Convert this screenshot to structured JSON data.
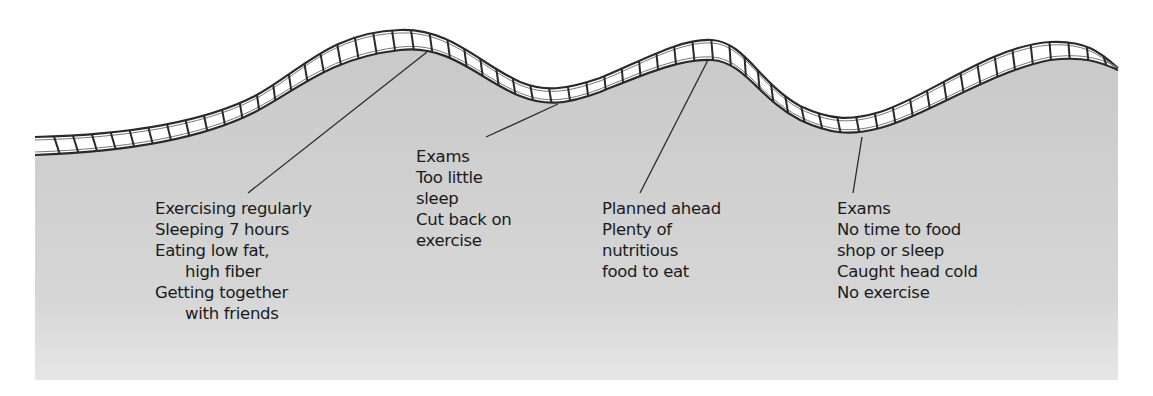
{
  "diagram": {
    "type": "roller-coaster wellness track",
    "colors": {
      "ground": "#cdcdcd",
      "ground_light": "#e4e4e4",
      "track_rail": "#2a2a2a",
      "track_fill": "#ffffff",
      "text": "#1a1a1a",
      "leader": "#2a2a2a"
    },
    "annotations": [
      {
        "id": "peak-1",
        "position": "peak",
        "lines": [
          {
            "text": "Exercising regularly",
            "indent": false
          },
          {
            "text": "Sleeping 7 hours",
            "indent": false
          },
          {
            "text": "Eating low fat,",
            "indent": false
          },
          {
            "text": "high fiber",
            "indent": true
          },
          {
            "text": "Getting together",
            "indent": false
          },
          {
            "text": "with friends",
            "indent": true
          }
        ]
      },
      {
        "id": "dip-1",
        "position": "dip",
        "lines": [
          {
            "text": "Exams",
            "indent": false
          },
          {
            "text": "Too little",
            "indent": false
          },
          {
            "text": "sleep",
            "indent": false
          },
          {
            "text": "Cut back on",
            "indent": false
          },
          {
            "text": "exercise",
            "indent": false
          }
        ]
      },
      {
        "id": "peak-2",
        "position": "peak",
        "lines": [
          {
            "text": "Planned ahead",
            "indent": false
          },
          {
            "text": "Plenty of",
            "indent": false
          },
          {
            "text": "nutritious",
            "indent": false
          },
          {
            "text": "food to eat",
            "indent": false
          }
        ]
      },
      {
        "id": "dip-2",
        "position": "dip",
        "lines": [
          {
            "text": "Exams",
            "indent": false
          },
          {
            "text": "No time to food",
            "indent": false
          },
          {
            "text": "shop or sleep",
            "indent": false
          },
          {
            "text": "Caught head cold",
            "indent": false
          },
          {
            "text": "No exercise",
            "indent": false
          }
        ]
      }
    ]
  }
}
